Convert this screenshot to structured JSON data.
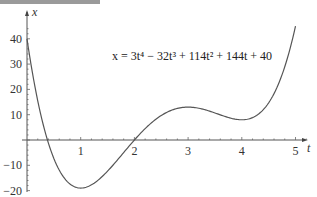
{
  "header_bar": {
    "color": "#9a9a9a"
  },
  "chart_data": {
    "type": "line",
    "title": "",
    "equation_label": "x = 3t⁴ − 32t³ + 114t² + 144t + 40",
    "xlabel": "t",
    "ylabel": "x",
    "xlim": [
      0,
      5.2
    ],
    "ylim": [
      -20,
      45
    ],
    "x_ticks": [
      1,
      2,
      3,
      4,
      5
    ],
    "y_ticks": [
      40,
      30,
      20,
      10,
      -10,
      -20
    ],
    "grid": false,
    "legend": null,
    "series": [
      {
        "name": "x(t)",
        "x": [
          0,
          0.25,
          0.5,
          0.75,
          1,
          1.25,
          1.5,
          1.75,
          2,
          2.25,
          2.5,
          2.75,
          3,
          3.25,
          3.5,
          3.75,
          4,
          4.25,
          4.5,
          4.75,
          5
        ],
        "values": [
          40,
          10.2,
          -6.6,
          -16.1,
          -19,
          -17.8,
          -13.6,
          -7.5,
          0,
          6.5,
          10.9,
          12.9,
          13,
          11.7,
          9.9,
          8.4,
          8,
          9.6,
          14.2,
          22.6,
          45
        ]
      }
    ],
    "line_color": "#555555"
  }
}
